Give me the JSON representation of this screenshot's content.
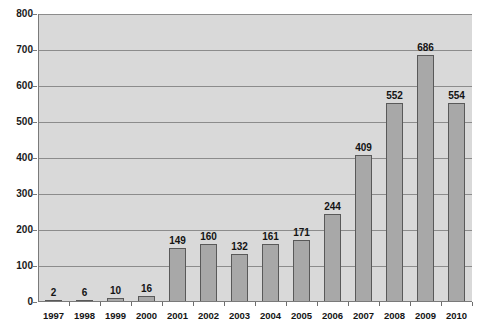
{
  "chart_data": {
    "type": "bar",
    "title": "",
    "subtitle": "",
    "xlabel": "",
    "ylabel": "",
    "categories": [
      "1997",
      "1998",
      "1999",
      "2000",
      "2001",
      "2002",
      "2003",
      "2004",
      "2005",
      "2006",
      "2007",
      "2008",
      "2009",
      "2010"
    ],
    "values": [
      2,
      6,
      10,
      16,
      149,
      160,
      132,
      161,
      171,
      244,
      409,
      552,
      686,
      554
    ],
    "data_labels": [
      "2",
      "6",
      "10",
      "16",
      "149",
      "160",
      "132",
      "161",
      "171",
      "244",
      "409",
      "552",
      "686",
      "554"
    ],
    "ylim": [
      0,
      800
    ],
    "ytick_labels": [
      "0",
      "100",
      "200",
      "300",
      "400",
      "500",
      "600",
      "700",
      "800"
    ],
    "ytick_values": [
      0,
      100,
      200,
      300,
      400,
      500,
      600,
      700,
      800
    ],
    "grid": true,
    "grid_axis": "y",
    "legend": false,
    "legend_position": "none",
    "show_data_labels": true,
    "colors": {
      "bar_fill": "#a8a8a8",
      "bar_border": "#595959",
      "plot_background": "#d9d9d9",
      "gridline": "#8c8c8c",
      "axis_line": "#7a7a7a",
      "text": "#141414",
      "page_background": "#ffffff"
    }
  }
}
